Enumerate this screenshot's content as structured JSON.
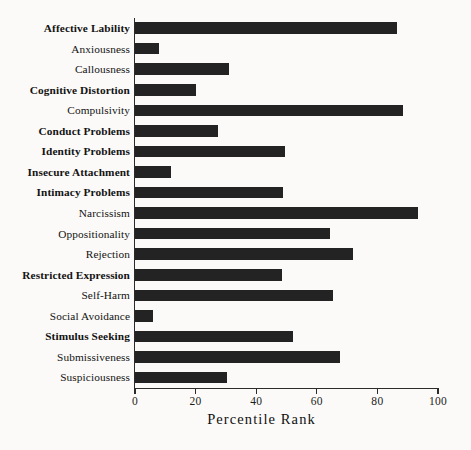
{
  "chart_data": {
    "type": "bar",
    "orientation": "horizontal",
    "title": "",
    "xlabel": "Percentile Rank",
    "ylabel": "",
    "xlim": [
      0,
      100
    ],
    "xticks": [
      0,
      20,
      40,
      60,
      80,
      100
    ],
    "xtick_labels": [
      "0",
      "20",
      "40",
      "60",
      "80",
      "100"
    ],
    "grid": false,
    "legend": null,
    "bar_color": "#232323",
    "background_color": "#fbfaf8",
    "categories": [
      "Affective Lability",
      "Anxiousness",
      "Callousness",
      "Cognitive Distortion",
      "Compulsivity",
      "Conduct Problems",
      "Identity Problems",
      "Insecure Attachment",
      "Intimacy Problems",
      "Narcissism",
      "Oppositionality",
      "Rejection",
      "Restricted Expression",
      "Self-Harm",
      "Social Avoidance",
      "Stimulus Seeking",
      "Submissiveness",
      "Suspiciousness"
    ],
    "values": [
      86.5,
      8,
      31,
      20,
      88.5,
      27.5,
      49.5,
      12,
      49,
      93.5,
      64.5,
      72,
      48.5,
      65.5,
      6,
      52,
      67.5,
      30.5
    ],
    "label_styles": [
      "bold",
      "normal",
      "normal",
      "bold",
      "normal",
      "bold",
      "bold",
      "bold",
      "bold",
      "normal",
      "normal",
      "normal",
      "bold",
      "normal",
      "normal",
      "bold",
      "normal",
      "normal"
    ]
  }
}
